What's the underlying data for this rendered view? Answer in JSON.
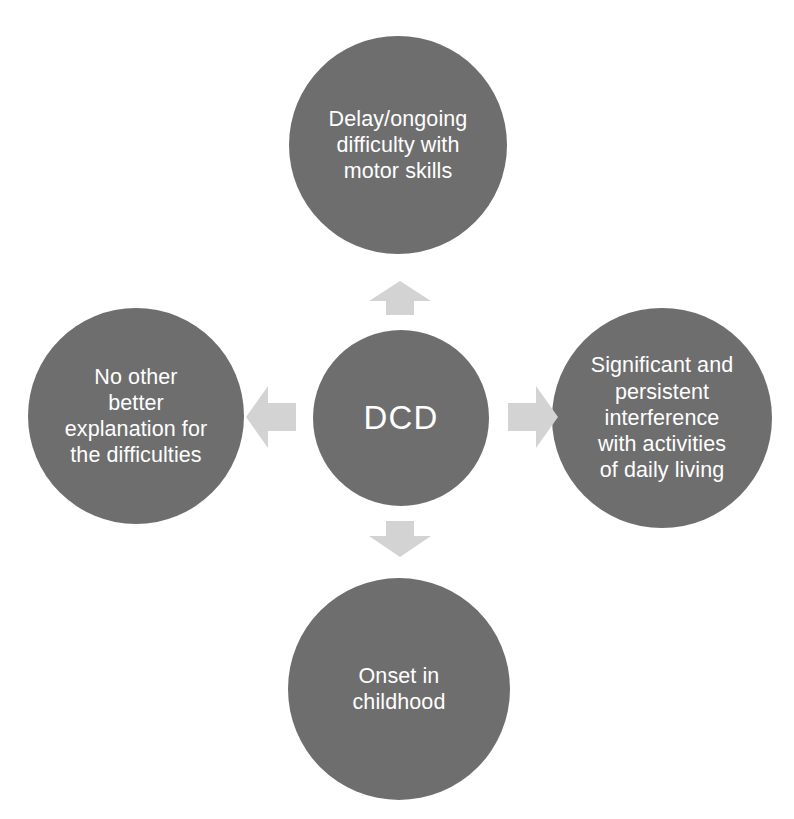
{
  "diagram": {
    "background_color": "#ffffff",
    "node_color": "#6e6e6e",
    "node_text_color": "#ffffff",
    "arrow_color": "#d3d3d3",
    "center": {
      "id": "dcd",
      "label": "DCD"
    },
    "nodes": [
      {
        "id": "motor-skills",
        "position": "top",
        "label": "Delay/ongoing\ndifficulty with\nmotor skills"
      },
      {
        "id": "no-other-explanation",
        "position": "left",
        "label": "No other\nbetter\nexplanation for\nthe difficulties"
      },
      {
        "id": "interference-daily-living",
        "position": "right",
        "label": "Significant and\npersistent\ninterference\nwith activities\nof daily living"
      },
      {
        "id": "onset-childhood",
        "position": "bottom",
        "label": "Onset in\nchildhood"
      }
    ],
    "arrows": [
      {
        "id": "arrow-up",
        "direction": "up",
        "from": "dcd",
        "to": "motor-skills"
      },
      {
        "id": "arrow-right",
        "direction": "right",
        "from": "dcd",
        "to": "interference-daily-living"
      },
      {
        "id": "arrow-down",
        "direction": "down",
        "from": "dcd",
        "to": "onset-childhood"
      },
      {
        "id": "arrow-left",
        "direction": "left",
        "from": "dcd",
        "to": "no-other-explanation"
      }
    ]
  }
}
